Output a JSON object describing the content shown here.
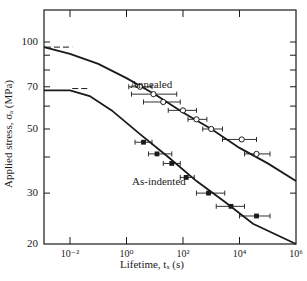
{
  "chart_data": {
    "type": "scatter",
    "title": "",
    "xlabel": "Lifetime, t_F (s)",
    "ylabel": "Applied stress, σ_A (MPa)",
    "xscale": "log",
    "yscale": "log",
    "xlim": [
      0.0012,
      1000000
    ],
    "ylim": [
      20,
      120
    ],
    "x_ticks": [
      {
        "value": 0.01,
        "label": "10⁻²"
      },
      {
        "value": 1,
        "label": "10⁰"
      },
      {
        "value": 100,
        "label": "10²"
      },
      {
        "value": 10000,
        "label": "10⁴"
      },
      {
        "value": 1000000,
        "label": "10⁶"
      }
    ],
    "y_ticks": [
      {
        "value": 20,
        "label": "20"
      },
      {
        "value": 30,
        "label": "30"
      },
      {
        "value": 40,
        "label": ""
      },
      {
        "value": 50,
        "label": "50"
      },
      {
        "value": 60,
        "label": ""
      },
      {
        "value": 70,
        "label": "70"
      },
      {
        "value": 80,
        "label": ""
      },
      {
        "value": 90,
        "label": ""
      },
      {
        "value": 100,
        "label": "100"
      }
    ],
    "grid": false,
    "legend": "inline labels",
    "series": [
      {
        "name": "Annealed",
        "marker": "open-circle",
        "label_pos": [
          130,
          78
        ],
        "threshold_dash": {
          "stress": 96,
          "x_from": 0.0013,
          "x_to": 0.012
        },
        "curve": [
          [
            0.0012,
            96
          ],
          [
            0.01,
            91
          ],
          [
            0.1,
            84
          ],
          [
            1,
            75
          ],
          [
            10,
            66
          ],
          [
            100,
            57
          ],
          [
            1000,
            50
          ],
          [
            10000,
            43
          ],
          [
            100000,
            38
          ],
          [
            1000000,
            33
          ]
        ],
        "points": [
          {
            "x": 3,
            "y": 70,
            "xerr": [
              1.2,
              8
            ]
          },
          {
            "x": 9,
            "y": 66,
            "xerr": [
              1.5,
              60
            ]
          },
          {
            "x": 20,
            "y": 62,
            "xerr": [
              4,
              80
            ]
          },
          {
            "x": 100,
            "y": 58,
            "xerr": [
              30,
              300
            ]
          },
          {
            "x": 300,
            "y": 54,
            "xerr": [
              150,
              700
            ]
          },
          {
            "x": 1000,
            "y": 50,
            "xerr": [
              500,
              2500
            ]
          },
          {
            "x": 12000,
            "y": 46,
            "xerr": [
              2500,
              40000
            ]
          },
          {
            "x": 40000,
            "y": 41,
            "xerr": [
              15000,
              120000
            ]
          }
        ]
      },
      {
        "name": "As-indented",
        "marker": "filled-square",
        "label_pos": [
          132,
          175
        ],
        "threshold_dash": {
          "stress": 69,
          "x_from": 0.012,
          "x_to": 0.05
        },
        "curve": [
          [
            0.0012,
            68
          ],
          [
            0.01,
            68
          ],
          [
            0.05,
            65
          ],
          [
            0.3,
            58
          ],
          [
            3,
            48
          ],
          [
            30,
            40
          ],
          [
            300,
            33
          ],
          [
            3000,
            28
          ],
          [
            30000,
            23.5
          ],
          [
            1000000,
            20
          ]
        ],
        "points": [
          {
            "x": 4,
            "y": 45,
            "xerr": [
              2,
              8
            ]
          },
          {
            "x": 12,
            "y": 41,
            "xerr": [
              6,
              40
            ]
          },
          {
            "x": 40,
            "y": 38,
            "xerr": [
              20,
              80
            ]
          },
          {
            "x": 130,
            "y": 34,
            "xerr": [
              80,
              250
            ]
          },
          {
            "x": 800,
            "y": 30,
            "xerr": [
              300,
              3000
            ]
          },
          {
            "x": 5000,
            "y": 27,
            "xerr": [
              1500,
              15000
            ]
          },
          {
            "x": 40000,
            "y": 25,
            "xerr": [
              10000,
              120000
            ]
          }
        ]
      }
    ]
  },
  "labels": {
    "ylabel": "Applied stress, σₐ (MPa)",
    "xlabel": "Lifetime, tₓ (s)",
    "annealed": "Annealed",
    "as_indented": "As-indented"
  },
  "colors": {
    "ink": "#1a1a1a",
    "background": "#ffffff"
  }
}
